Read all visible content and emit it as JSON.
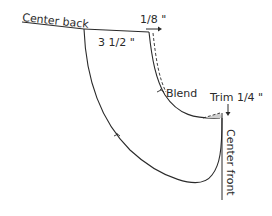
{
  "diagram": {
    "type": "sewing-pattern-collar",
    "labels": {
      "center_back": "Center back",
      "measure_top": "3 1/2 \"",
      "extend": "1/8 \"",
      "blend": "Blend",
      "trim": "Trim 1/4 \"",
      "center_front": "Center front"
    },
    "colors": {
      "line": "#2a2a2a",
      "shade": "#cfcfcf",
      "background": "#ffffff"
    }
  }
}
